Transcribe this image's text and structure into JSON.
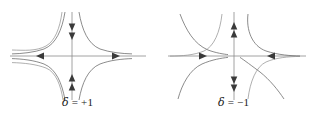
{
  "figure": {
    "background_color": "#ffffff",
    "stroke_color": "#6e6e6e",
    "axis_color": "#8a8a8a",
    "text_color": "#1a1a1a"
  },
  "panels": [
    {
      "id": "panel-left",
      "name": "phase-portrait-delta-positive",
      "caption": {
        "symbol": "δ",
        "equals": " = ",
        "value": "+1",
        "full": "δ = +1"
      },
      "axes": {
        "origin": {
          "x": 72,
          "y": 56
        },
        "x_axis": {
          "from": 10,
          "to": 146,
          "y": 56
        },
        "y_axis": {
          "x": 72,
          "from": 12,
          "to": 100
        }
      },
      "flow_arrows": [
        {
          "name": "arrow-x-negative",
          "x": 41,
          "y": 56,
          "direction": "left",
          "meaning": "outward-from-origin"
        },
        {
          "name": "arrow-x-positive",
          "x": 113,
          "y": 56,
          "direction": "right",
          "meaning": "outward-from-origin"
        },
        {
          "name": "arrow-y-positive-upper",
          "x": 72,
          "y": 26,
          "direction": "down",
          "meaning": "inward-toward-origin"
        },
        {
          "name": "arrow-y-positive-lower",
          "x": 72,
          "y": 33,
          "direction": "down",
          "meaning": "inward-toward-origin"
        },
        {
          "name": "arrow-y-negative-upper",
          "x": 72,
          "y": 80,
          "direction": "up",
          "meaning": "inward-toward-origin"
        },
        {
          "name": "arrow-y-negative-lower",
          "x": 72,
          "y": 87,
          "direction": "up",
          "meaning": "inward-toward-origin"
        }
      ],
      "trajectory_count": 4,
      "trajectory_shape": "hyperbolic-saddle-opening-left-right"
    },
    {
      "id": "panel-right",
      "name": "phase-portrait-delta-negative",
      "caption": {
        "symbol": "δ",
        "equals": " = ",
        "value": "−1",
        "full": "δ = −1"
      },
      "axes": {
        "origin": {
          "x": 78,
          "y": 56
        },
        "x_axis": {
          "from": 12,
          "to": 150,
          "y": 56
        },
        "y_axis": {
          "x": 78,
          "from": 12,
          "to": 100
        }
      },
      "flow_arrows": [
        {
          "name": "arrow-x-negative",
          "x": 43,
          "y": 56,
          "direction": "right",
          "meaning": "inward-toward-origin"
        },
        {
          "name": "arrow-x-positive",
          "x": 119,
          "y": 56,
          "direction": "left",
          "meaning": "inward-toward-origin"
        },
        {
          "name": "arrow-y-positive-upper",
          "x": 78,
          "y": 25,
          "direction": "up",
          "meaning": "outward-from-origin"
        },
        {
          "name": "arrow-y-positive-lower",
          "x": 78,
          "y": 33,
          "direction": "up",
          "meaning": "outward-from-origin"
        },
        {
          "name": "arrow-y-negative-upper",
          "x": 78,
          "y": 80,
          "direction": "down",
          "meaning": "outward-from-origin"
        },
        {
          "name": "arrow-y-negative-lower",
          "x": 78,
          "y": 88,
          "direction": "down",
          "meaning": "outward-from-origin"
        }
      ],
      "trajectory_count": 4,
      "trajectory_shape": "hyperbolic-saddle-opening-up-down"
    }
  ]
}
